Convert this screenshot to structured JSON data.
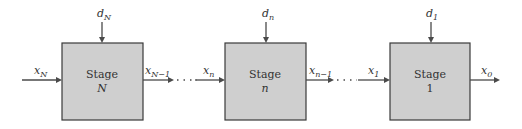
{
  "diagram": {
    "stages": [
      {
        "title": "Stage",
        "index": "N",
        "index_italic": true,
        "decision": {
          "base": "d",
          "sub": "N"
        },
        "input": {
          "base": "x",
          "sub": "N"
        },
        "output": {
          "base": "x",
          "sub": "N−1"
        }
      },
      {
        "title": "Stage",
        "index": "n",
        "index_italic": true,
        "decision": {
          "base": "d",
          "sub": "n"
        },
        "input": {
          "base": "x",
          "sub": "n"
        },
        "output": {
          "base": "x",
          "sub": "n−1"
        }
      },
      {
        "title": "Stage",
        "index": "1",
        "index_italic": false,
        "decision": {
          "base": "d",
          "sub": "1"
        },
        "input": {
          "base": "x",
          "sub": "1"
        },
        "output": {
          "base": "x",
          "sub": "0"
        }
      }
    ],
    "connector_style": "dotted-ellipsis"
  }
}
